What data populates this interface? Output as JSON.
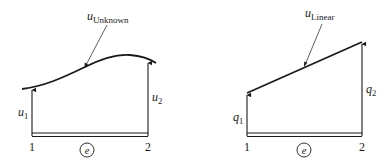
{
  "left_panel": {
    "curve_label": {
      "base": "u",
      "sub": "Unknown"
    },
    "left_value": {
      "base": "u",
      "sub": "1"
    },
    "right_value": {
      "base": "u",
      "sub": "2"
    },
    "node_left": "1",
    "node_right": "2",
    "element_label": "e"
  },
  "right_panel": {
    "curve_label": {
      "base": "u",
      "sub": "Linear"
    },
    "left_value": {
      "base": "q",
      "sub": "1"
    },
    "right_value": {
      "base": "q",
      "sub": "2"
    },
    "node_left": "1",
    "node_right": "2",
    "element_label": "e"
  },
  "colors": {
    "stroke": "#1a1a1a",
    "background": "#ffffff"
  }
}
